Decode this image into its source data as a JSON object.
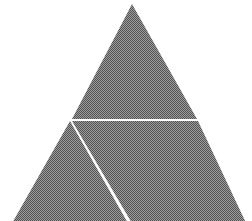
{
  "canvas": {
    "width": 252,
    "height": 221,
    "background_color": "#ffffff",
    "title": "Subdivided triangle figure"
  },
  "figure": {
    "name": "triangle-diagram",
    "description": "A large solid gray triangle, rendered with a halftone dither texture, subdivided by two white gap lines into three regions.",
    "fill_color": "#7a7a7a",
    "fill_texture": "halftone-dither-50",
    "gap_color": "#ffffff",
    "gap_width_px": 4
  },
  "shapes": {
    "outer_triangle": {
      "label": "outer-triangle",
      "points": "132,4 247,225 11,225",
      "apex": [
        132,
        4
      ],
      "bottom_left": [
        11,
        225
      ],
      "bottom_right": [
        247,
        225
      ],
      "clipped_at_bottom": true
    },
    "regions": [
      {
        "label": "upper-triangle-region",
        "points": "132,4 197,119 72,119",
        "position": "top"
      },
      {
        "label": "lower-left-region",
        "points": "70,121 129,225 11,225",
        "position": "bottom-left"
      },
      {
        "label": "lower-right-region",
        "points": "72,121 198,121 247,225 133,225",
        "position": "bottom-right"
      }
    ],
    "gap_lines": [
      {
        "label": "horizontal-gap-line",
        "x1": 70,
        "y1": 119,
        "x2": 197,
        "y2": 119,
        "orientation": "horizontal"
      },
      {
        "label": "diagonal-gap-line",
        "x1": 70,
        "y1": 119,
        "x2": 131,
        "y2": 225,
        "orientation": "diagonal-down-right"
      }
    ],
    "vertex_junction": {
      "label": "gap-junction-point",
      "x": 70,
      "y": 119
    }
  }
}
